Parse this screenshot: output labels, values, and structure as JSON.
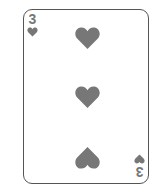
{
  "card": {
    "rank": "3",
    "suit": "hearts",
    "suit_icon": "heart-icon",
    "pip_count": 3,
    "pip_color": "#777777",
    "border_color": "#555555"
  }
}
